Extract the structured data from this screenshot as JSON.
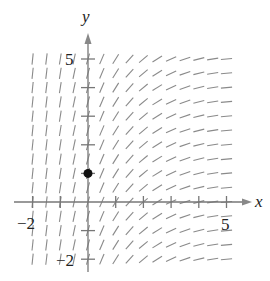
{
  "chart_data": {
    "type": "slope_field",
    "title": "",
    "xlabel": "x",
    "ylabel": "y",
    "xlim": [
      -2,
      5
    ],
    "ylim": [
      -2,
      5
    ],
    "x_tick_labels": [
      {
        "value": -2,
        "label": "−2"
      },
      {
        "value": 5,
        "label": "5"
      }
    ],
    "y_tick_labels": [
      {
        "value": 5,
        "label": "5"
      },
      {
        "value": -2,
        "label": "−2"
      }
    ],
    "x_ticks": [
      -2,
      -1,
      1,
      2,
      3,
      4,
      5
    ],
    "y_ticks": [
      -2,
      -1,
      1,
      2,
      3,
      4,
      5
    ],
    "grid": false,
    "field_spacing": 0.5,
    "slope_angles_by_x_deg": [
      {
        "x": -2.0,
        "angle": 84
      },
      {
        "x": -1.5,
        "angle": 83
      },
      {
        "x": -1.0,
        "angle": 81
      },
      {
        "x": -0.5,
        "angle": 78
      },
      {
        "x": 0.0,
        "angle": 74
      },
      {
        "x": 0.5,
        "angle": 67
      },
      {
        "x": 1.0,
        "angle": 58
      },
      {
        "x": 1.5,
        "angle": 48
      },
      {
        "x": 2.0,
        "angle": 40
      },
      {
        "x": 2.5,
        "angle": 32
      },
      {
        "x": 3.0,
        "angle": 25
      },
      {
        "x": 3.5,
        "angle": 19
      },
      {
        "x": 4.0,
        "angle": 14
      },
      {
        "x": 4.5,
        "angle": 9
      },
      {
        "x": 5.0,
        "angle": 5
      }
    ],
    "marked_points": [
      {
        "x": 0,
        "y": 1
      }
    ],
    "colors": {
      "axis": "#777777",
      "segment": "#8a8a8a",
      "point": "#111111",
      "text": "#222222"
    }
  },
  "labels": {
    "x_axis": "x",
    "y_axis": "y",
    "x_min": "−2",
    "x_max": "5",
    "y_max": "5",
    "y_min": "−2"
  }
}
